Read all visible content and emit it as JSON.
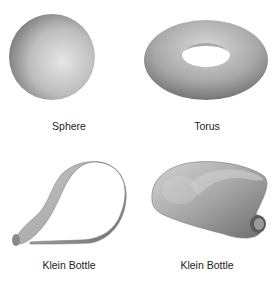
{
  "figure": {
    "shapes": [
      {
        "id": "sphere",
        "label": "Sphere"
      },
      {
        "id": "torus",
        "label": "Torus"
      },
      {
        "id": "klein-bottle-1",
        "label": "Klein Bottle"
      },
      {
        "id": "klein-bottle-2",
        "label": "Klein Bottle"
      }
    ]
  }
}
